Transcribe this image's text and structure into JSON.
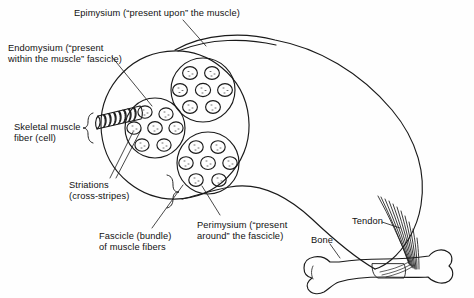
{
  "figure": {
    "background_color": "#fefefe",
    "ink_color": "#1a1a1a"
  },
  "labels": {
    "epimysium": "Epimysium (“present upon” the muscle)",
    "endomysium_line1": "Endomysium (“present",
    "endomysium_line2": "within the muscle” fascicle)",
    "fiber_line1": "Skeletal muscle",
    "fiber_line2": "fiber (cell)",
    "striations_line1": "Striations",
    "striations_line2": "(cross-stripes)",
    "fascicle_line1": "Fascicle (bundle)",
    "fascicle_line2": "of muscle fibers",
    "perimysium_line1": "Perimysium (“present",
    "perimysium_line2": "around” the fascicle)",
    "tendon": "Tendon",
    "bone": "Bone"
  },
  "structures": {
    "muscle_belly": "epimysium-wrapped muscle outline",
    "fascicle_count": 3,
    "fibers_per_fascicle": 8,
    "muscle_fiber_striation_bands": 9,
    "tendon_strand_count": 11,
    "bone_type": "long-bone"
  }
}
